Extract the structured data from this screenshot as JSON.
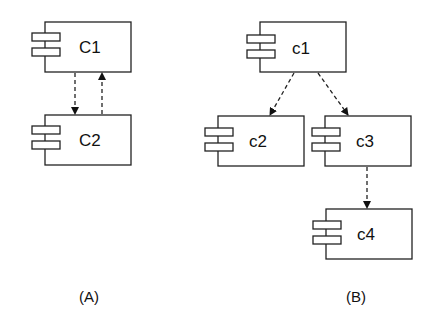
{
  "diagrams": {
    "A": {
      "caption": "(A)",
      "components": [
        {
          "id": "C1",
          "label": "C1"
        },
        {
          "id": "C2",
          "label": "C2"
        }
      ],
      "dependencies": [
        {
          "from": "C1",
          "to": "C2",
          "style": "dashed-arrow"
        },
        {
          "from": "C2",
          "to": "C1",
          "style": "dashed-arrow"
        }
      ]
    },
    "B": {
      "caption": "(B)",
      "components": [
        {
          "id": "c1",
          "label": "c1"
        },
        {
          "id": "c2",
          "label": "c2"
        },
        {
          "id": "c3",
          "label": "c3"
        },
        {
          "id": "c4",
          "label": "c4"
        }
      ],
      "dependencies": [
        {
          "from": "c1",
          "to": "c2",
          "style": "dashed-arrow"
        },
        {
          "from": "c1",
          "to": "c3",
          "style": "dashed-arrow"
        },
        {
          "from": "c3",
          "to": "c4",
          "style": "dashed-arrow"
        }
      ]
    }
  },
  "colors": {
    "stroke": "#222222",
    "background": "#ffffff"
  }
}
